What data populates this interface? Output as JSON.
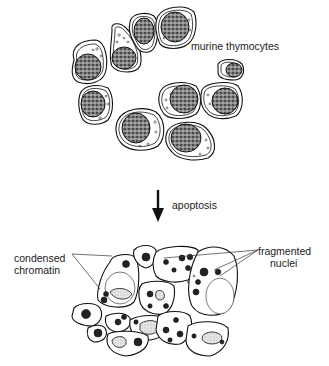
{
  "figure": {
    "top_panel": {
      "label": "murine thymocytes",
      "cell_count": 10,
      "description": "healthy thymocytes with large stippled round nuclei"
    },
    "transition": {
      "label": "apoptosis",
      "arrow_direction": "down"
    },
    "bottom_panel": {
      "labels": {
        "left_line1": "condensed",
        "left_line2": "chromatin",
        "right_line1": "fragmented",
        "right_line2": "nuclei"
      },
      "description": "compacted apoptotic cells with condensed chromatin and fragmented nuclei"
    },
    "colors": {
      "ink": "#111111",
      "background": "#ffffff"
    }
  }
}
